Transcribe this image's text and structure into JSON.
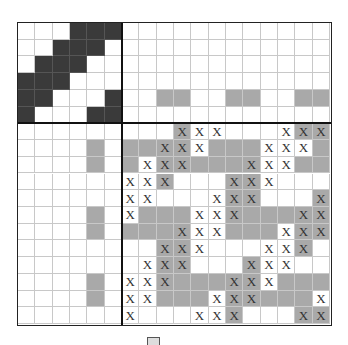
{
  "puzzle": {
    "type": "nonogram",
    "grid_size": 18,
    "clue_size": 6,
    "body_size": 12,
    "colors": {
      "dark": "#3a3a3a",
      "gray": "#a9a9a9",
      "white": "#ffffff",
      "grid_line": "#c8c8c8",
      "block_border": "#111111"
    },
    "mark_glyph": "X",
    "corner_block": [
      [
        0,
        0,
        0,
        1,
        1,
        1
      ],
      [
        0,
        0,
        1,
        1,
        1,
        0
      ],
      [
        0,
        1,
        1,
        1,
        0,
        0
      ],
      [
        1,
        1,
        1,
        0,
        0,
        0
      ],
      [
        1,
        1,
        0,
        0,
        0,
        1
      ],
      [
        1,
        0,
        0,
        0,
        1,
        1
      ]
    ],
    "top_clue_area": [
      "............",
      "............",
      "............",
      "............",
      "..gg..gg..gg",
      "............"
    ],
    "left_clue_area": [
      "......",
      "....g.",
      "....g.",
      "......",
      "......",
      "....g.",
      "....g.",
      "......",
      "......",
      "....g.",
      "....g.",
      "......"
    ],
    "body": [
      [
        "w",
        "w",
        "w",
        "gx",
        "wx",
        "wx",
        "w",
        "w",
        "w",
        "wx",
        "gx",
        "gx"
      ],
      [
        "g",
        "g",
        "gx",
        "gx",
        "wx",
        "g",
        "g",
        "g",
        "wx",
        "wx",
        "wx",
        "g"
      ],
      [
        "g",
        "wx",
        "gx",
        "gx",
        "g",
        "g",
        "g",
        "gx",
        "wx",
        "wx",
        "g",
        "g"
      ],
      [
        "wx",
        "wx",
        "gx",
        "w",
        "w",
        "w",
        "gx",
        "gx",
        "wx",
        "w",
        "w",
        "w"
      ],
      [
        "wx",
        "wx",
        "w",
        "w",
        "w",
        "wx",
        "gx",
        "gx",
        "w",
        "w",
        "w",
        "gx"
      ],
      [
        "wx",
        "g",
        "g",
        "g",
        "wx",
        "wx",
        "gx",
        "g",
        "g",
        "g",
        "gx",
        "gx"
      ],
      [
        "g",
        "g",
        "g",
        "gx",
        "wx",
        "wx",
        "g",
        "g",
        "g",
        "wx",
        "gx",
        "gx"
      ],
      [
        "w",
        "w",
        "gx",
        "gx",
        "wx",
        "w",
        "w",
        "w",
        "wx",
        "wx",
        "gx",
        "w"
      ],
      [
        "w",
        "wx",
        "gx",
        "gx",
        "w",
        "w",
        "w",
        "gx",
        "wx",
        "wx",
        "w",
        "w"
      ],
      [
        "wx",
        "wx",
        "gx",
        "g",
        "g",
        "g",
        "gx",
        "gx",
        "wx",
        "g",
        "g",
        "g"
      ],
      [
        "wx",
        "wx",
        "g",
        "g",
        "g",
        "wx",
        "gx",
        "gx",
        "g",
        "g",
        "g",
        "wx"
      ],
      [
        "wx",
        "w",
        "w",
        "w",
        "wx",
        "wx",
        "gx",
        "w",
        "w",
        "w",
        "gx",
        "gx"
      ]
    ]
  },
  "legend": {
    "icon": "box-icon",
    "text": ""
  }
}
